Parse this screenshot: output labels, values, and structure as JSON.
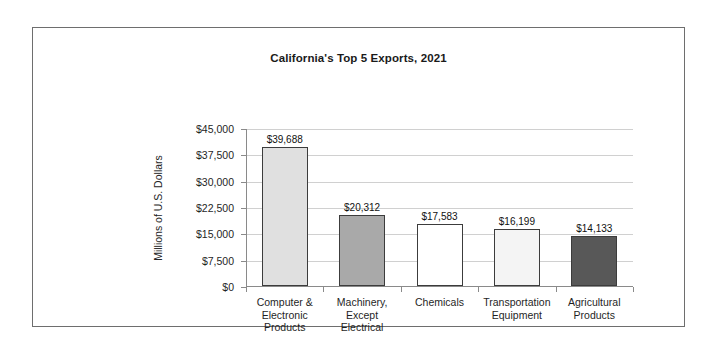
{
  "chart_data": {
    "type": "bar",
    "title": "California's Top 5 Exports, 2021",
    "xlabel": "",
    "ylabel": "Millions of U.S. Dollars",
    "ylim": [
      0,
      45000
    ],
    "ytick_values": [
      0,
      7500,
      15000,
      22500,
      30000,
      37500,
      45000
    ],
    "ytick_labels": [
      "$0",
      "$7,500",
      "$15,000",
      "$22,500",
      "$30,000",
      "$37,500",
      "$45,000"
    ],
    "grid": true,
    "legend": "none",
    "categories": [
      "Computer &\nElectronic\nProducts",
      "Machinery,\nExcept\nElectrical",
      "Chemicals",
      "Transportation\nEquipment",
      "Agricultural\nProducts"
    ],
    "values": [
      39688,
      20312,
      17583,
      16199,
      14133
    ],
    "data_labels": [
      "$39,688",
      "$20,312",
      "$17,583",
      "$16,199",
      "$14,133"
    ],
    "bar_colors": [
      "#e0e0e0",
      "#a9a9a9",
      "#ffffff",
      "#f4f4f4",
      "#585858"
    ],
    "bar_edge_color": "#3c3c3c",
    "bars": [
      {
        "category_lines": [
          "Computer &",
          "Electronic",
          "Products"
        ],
        "value": 39688,
        "label": "$39,688",
        "color": "#e0e0e0"
      },
      {
        "category_lines": [
          "Machinery,",
          "Except",
          "Electrical"
        ],
        "value": 20312,
        "label": "$20,312",
        "color": "#a9a9a9"
      },
      {
        "category_lines": [
          "Chemicals"
        ],
        "value": 17583,
        "label": "$17,583",
        "color": "#ffffff"
      },
      {
        "category_lines": [
          "Transportation",
          "Equipment"
        ],
        "value": 16199,
        "label": "$16,199",
        "color": "#f4f4f4"
      },
      {
        "category_lines": [
          "Agricultural",
          "Products"
        ],
        "value": 14133,
        "label": "$14,133",
        "color": "#585858"
      }
    ]
  },
  "frame": {
    "border_color": "#6e6e6e"
  }
}
